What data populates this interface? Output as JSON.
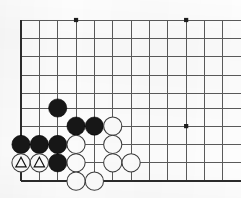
{
  "figure": {
    "kind": "go-board-diagram",
    "board_size_shown": {
      "columns": 12,
      "rows": 10
    },
    "background_color": "#fdfdfd",
    "grid_color": "#5a5a5a",
    "edge_color": "#2b2b2b",
    "black_stone_color": "#171717",
    "white_stone_color": "#fbfbfb",
    "white_stone_outline_color": "#3a3a3a",
    "mark_color": "#111111"
  },
  "geometry": {
    "origin_x": 21,
    "origin_y": 20,
    "spacing": 18.35,
    "stone_radius": 9.1,
    "star_radius": 2.1,
    "columns_x": [
      21,
      39.35,
      57.7,
      76.05,
      94.4,
      112.75,
      131.1,
      149.45,
      167.8,
      186.15,
      204.5,
      222.85
    ],
    "rows_y": [
      20,
      38.35,
      56.7,
      75.05,
      93.4,
      108,
      126.1,
      144.45,
      162.8,
      181.15
    ]
  },
  "edges": {
    "left": true,
    "bottom": true,
    "top": false,
    "right": false
  },
  "star_points": [
    {
      "name": "star-top-left",
      "x": 76.05,
      "y": 20
    },
    {
      "name": "star-top-right",
      "x": 186.15,
      "y": 20
    },
    {
      "name": "star-right-center",
      "x": 186.15,
      "y": 126.1
    }
  ],
  "stones": [
    {
      "name": "stone-black-1",
      "color": "black",
      "x": 57.7,
      "y": 108,
      "mark": "none"
    },
    {
      "name": "stone-black-2",
      "color": "black",
      "x": 76.05,
      "y": 126.1,
      "mark": "none"
    },
    {
      "name": "stone-black-3",
      "color": "black",
      "x": 94.4,
      "y": 126.1,
      "mark": "none"
    },
    {
      "name": "stone-black-4",
      "color": "black",
      "x": 21,
      "y": 144.45,
      "mark": "none"
    },
    {
      "name": "stone-black-5",
      "color": "black",
      "x": 39.35,
      "y": 144.45,
      "mark": "none"
    },
    {
      "name": "stone-black-6",
      "color": "black",
      "x": 57.7,
      "y": 144.45,
      "mark": "none"
    },
    {
      "name": "stone-black-7",
      "color": "black",
      "x": 57.7,
      "y": 162.8,
      "mark": "none"
    },
    {
      "name": "stone-white-1",
      "color": "white",
      "x": 112.75,
      "y": 126.1,
      "mark": "none"
    },
    {
      "name": "stone-white-2",
      "color": "white",
      "x": 76.05,
      "y": 144.45,
      "mark": "none"
    },
    {
      "name": "stone-white-3",
      "color": "white",
      "x": 112.75,
      "y": 144.45,
      "mark": "none"
    },
    {
      "name": "stone-white-triangle-1",
      "color": "white",
      "x": 21,
      "y": 162.8,
      "mark": "triangle"
    },
    {
      "name": "stone-white-triangle-2",
      "color": "white",
      "x": 39.35,
      "y": 162.8,
      "mark": "triangle"
    },
    {
      "name": "stone-white-4",
      "color": "white",
      "x": 76.05,
      "y": 162.8,
      "mark": "none"
    },
    {
      "name": "stone-white-5",
      "color": "white",
      "x": 112.75,
      "y": 162.8,
      "mark": "none"
    },
    {
      "name": "stone-white-6",
      "color": "white",
      "x": 131.1,
      "y": 162.8,
      "mark": "none"
    },
    {
      "name": "stone-white-7",
      "color": "white",
      "x": 76.05,
      "y": 181.15,
      "mark": "none"
    },
    {
      "name": "stone-white-8",
      "color": "white",
      "x": 94.4,
      "y": 181.15,
      "mark": "none"
    }
  ]
}
